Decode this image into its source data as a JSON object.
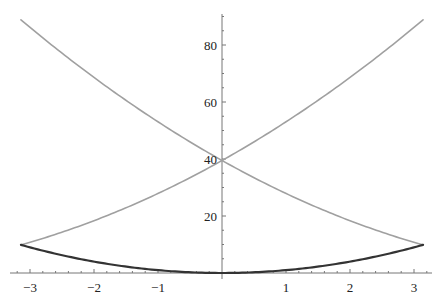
{
  "chart_data": {
    "type": "line",
    "title": "",
    "xlabel": "",
    "ylabel": "",
    "xlim": [
      -3.3,
      3.3
    ],
    "ylim": [
      0,
      91
    ],
    "grid": false,
    "legend": null,
    "x_ticks": [
      -3,
      -2,
      -1,
      1,
      2,
      3
    ],
    "x_tick_labels": [
      "−3",
      "−2",
      "−1",
      "1",
      "2",
      "3"
    ],
    "y_ticks": [
      20,
      40,
      60,
      80
    ],
    "y_tick_labels": [
      "20",
      "40",
      "60",
      "80"
    ],
    "x_minor_step": 0.2,
    "y_minor_step": 5,
    "domain": [
      -3.14159,
      3.14159
    ],
    "series": [
      {
        "name": "x^2",
        "color": "#333333",
        "stroke_width": 2.2,
        "x": [
          -3.14,
          -3,
          -2.5,
          -2,
          -1.5,
          -1,
          -0.5,
          0,
          0.5,
          1,
          1.5,
          2,
          2.5,
          3,
          3.14
        ],
        "values": [
          9.87,
          9.0,
          6.25,
          4.0,
          2.25,
          1.0,
          0.25,
          0.0,
          0.25,
          1.0,
          2.25,
          4.0,
          6.25,
          9.0,
          9.87
        ]
      },
      {
        "name": "(x + 2π)^2",
        "color": "#a0a0a0",
        "stroke_width": 1.6,
        "x": [
          -3.14,
          -3,
          -2.5,
          -2,
          -1.5,
          -1,
          -0.5,
          0,
          0.5,
          1,
          1.5,
          2,
          2.5,
          3,
          3.14
        ],
        "values": [
          9.87,
          10.77,
          14.33,
          18.39,
          22.96,
          28.04,
          33.62,
          39.48,
          45.84,
          52.7,
          60.06,
          67.91,
          76.26,
          85.1,
          88.83
        ]
      },
      {
        "name": "(x − 2π)^2",
        "color": "#a0a0a0",
        "stroke_width": 1.6,
        "x": [
          -3.14,
          -3,
          -2.5,
          -2,
          -1.5,
          -1,
          -0.5,
          0,
          0.5,
          1,
          1.5,
          2,
          2.5,
          3,
          3.14
        ],
        "values": [
          88.83,
          85.1,
          76.26,
          67.91,
          60.06,
          52.7,
          45.84,
          39.48,
          33.62,
          28.04,
          22.96,
          18.39,
          14.33,
          10.77,
          9.87
        ]
      }
    ],
    "layout": {
      "origin_px": [
        222,
        273
      ],
      "px_per_x": 64,
      "px_per_y": 2.85,
      "x_axis_px": [
        10,
        432
      ],
      "y_axis_top_px": 14
    }
  }
}
